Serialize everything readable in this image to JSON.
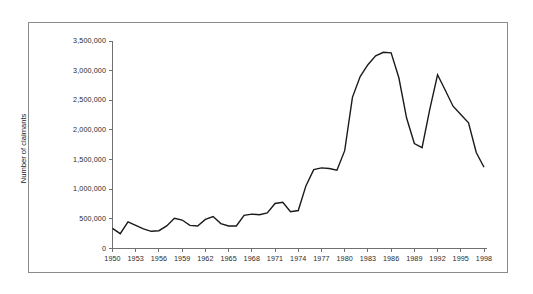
{
  "chart_data": {
    "type": "line",
    "title": "",
    "xlabel": "",
    "ylabel": "Number of claimants",
    "xlim": [
      1950,
      1998
    ],
    "ylim": [
      0,
      3500000
    ],
    "grid": false,
    "legend": "none",
    "y_ticks": [
      0,
      500000,
      1000000,
      1500000,
      2000000,
      2500000,
      3000000,
      3500000
    ],
    "y_tick_labels": [
      "0",
      "500,000",
      "1,000,000",
      "1,500,000",
      "2,000,000",
      "2,500,000",
      "3,000,000",
      "3,500,000"
    ],
    "x_ticks": [
      1950,
      1953,
      1956,
      1959,
      1962,
      1965,
      1968,
      1971,
      1974,
      1977,
      1980,
      1983,
      1986,
      1989,
      1992,
      1995,
      1998
    ],
    "x_tick_labels": [
      "1950",
      "1953",
      "1956",
      "1959",
      "1962",
      "1965",
      "1968",
      "1971",
      "1974",
      "1977",
      "1980",
      "1983",
      "1986",
      "1989",
      "1992",
      "1995",
      "1998"
    ],
    "x": [
      1950,
      1951,
      1952,
      1953,
      1954,
      1955,
      1956,
      1957,
      1958,
      1959,
      1960,
      1961,
      1962,
      1963,
      1964,
      1965,
      1966,
      1967,
      1968,
      1969,
      1970,
      1971,
      1972,
      1973,
      1974,
      1975,
      1976,
      1977,
      1978,
      1979,
      1980,
      1981,
      1982,
      1983,
      1984,
      1985,
      1986,
      1987,
      1988,
      1989,
      1990,
      1991,
      1992,
      1993,
      1994,
      1995,
      1996,
      1997,
      1998
    ],
    "series": [
      {
        "name": "Number of claimants",
        "color": "#1a1a1a",
        "values": [
          340000,
          250000,
          450000,
          390000,
          330000,
          290000,
          300000,
          380000,
          510000,
          480000,
          390000,
          380000,
          490000,
          540000,
          420000,
          380000,
          380000,
          560000,
          580000,
          570000,
          600000,
          760000,
          780000,
          620000,
          640000,
          1060000,
          1330000,
          1360000,
          1350000,
          1320000,
          1650000,
          2550000,
          2900000,
          3100000,
          3250000,
          3310000,
          3300000,
          2880000,
          2200000,
          1770000,
          1700000,
          2350000,
          2930000,
          2670000,
          2400000,
          2260000,
          2120000,
          1620000,
          1370000
        ]
      }
    ]
  },
  "axis": {
    "y_title": "Number of claimants"
  }
}
